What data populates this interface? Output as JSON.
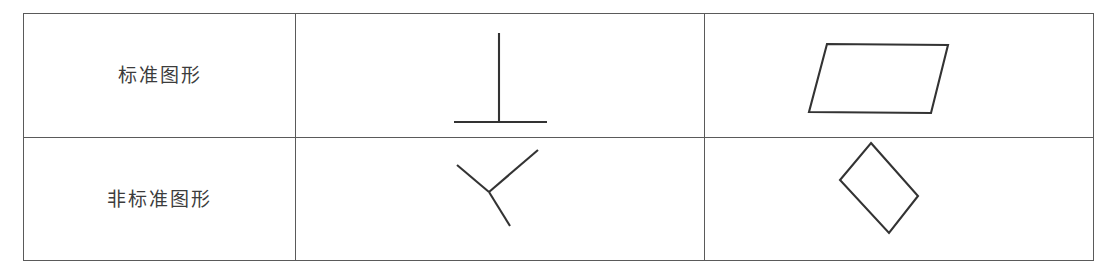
{
  "table": {
    "rows": [
      {
        "label": "标准图形",
        "label_name": "standard-figure",
        "figures": [
          {
            "name": "perpendicular-symbol-upright",
            "type": "lines",
            "description": "upright inverted-T (perpendicular sign)",
            "segments": [
              {
                "x1": 203,
                "y1": 19,
                "x2": 203,
                "y2": 108
              },
              {
                "x1": 158,
                "y1": 108,
                "x2": 251,
                "y2": 108
              }
            ]
          },
          {
            "name": "parallelogram-upright",
            "type": "polygon",
            "description": "parallelogram leaning right",
            "points": "122,30 243,31 226,99 104,98"
          }
        ]
      },
      {
        "label": "非标准图形",
        "label_name": "nonstandard-figure",
        "figures": [
          {
            "name": "perpendicular-symbol-rotated",
            "type": "lines",
            "description": "rotated inverted-T (perpendicular sign)",
            "segments": [
              {
                "x1": 161,
                "y1": 27,
                "x2": 193,
                "y2": 54
              },
              {
                "x1": 193,
                "y1": 54,
                "x2": 242,
                "y2": 12
              },
              {
                "x1": 193,
                "y1": 54,
                "x2": 214,
                "y2": 88
              }
            ]
          },
          {
            "name": "rotated-rectangle-diamond",
            "type": "polygon",
            "description": "rectangle rotated about 40 degrees, appears as a diamond",
            "points": "166,5 213,58 184,95 135,42"
          }
        ]
      }
    ]
  },
  "colors": {
    "border": "#5a5a5a",
    "stroke": "#333333",
    "text": "#3c3c3c",
    "background": "#ffffff"
  }
}
